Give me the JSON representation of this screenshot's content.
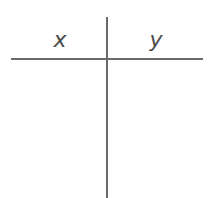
{
  "table": {
    "columns": [
      {
        "header": "x",
        "values": []
      },
      {
        "header": "y",
        "values": []
      }
    ],
    "line_color": "#6a6a6a",
    "text_color": "#4a4a4a"
  }
}
